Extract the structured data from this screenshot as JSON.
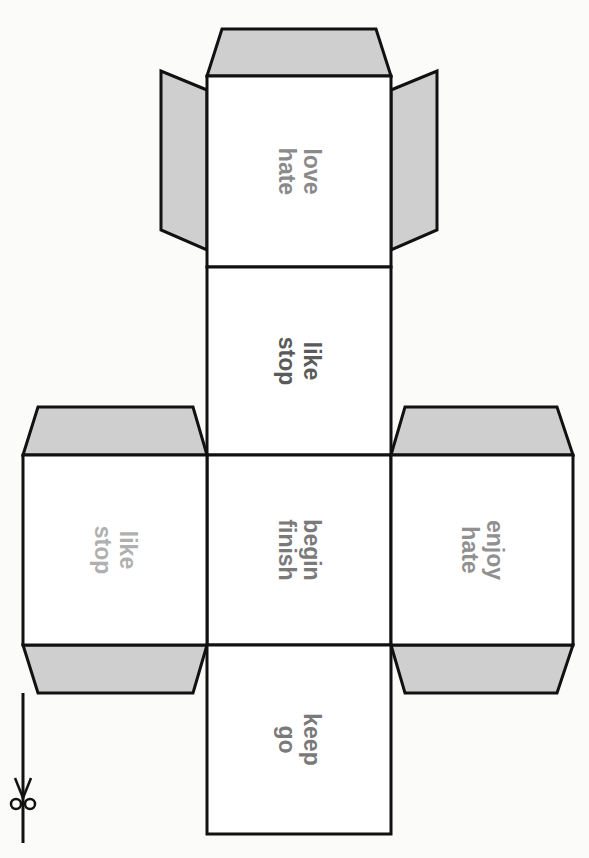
{
  "colors": {
    "outline": "#111111",
    "tab_fill": "#cfcfcf",
    "face_fill": "#ffffff",
    "background": "#fbfbfa"
  },
  "faces": [
    {
      "id": "top",
      "line1": "love",
      "line2": "hate",
      "color": "#8a8a8a"
    },
    {
      "id": "upper-middle",
      "line1": "like",
      "line2": "stop",
      "color": "#5a5a5a"
    },
    {
      "id": "center",
      "line1": "begin",
      "line2": "finish",
      "color": "#7a7a7a"
    },
    {
      "id": "left",
      "line1": "like",
      "line2": "stop",
      "color": "#b0b0b0"
    },
    {
      "id": "right",
      "line1": "enjoy",
      "line2": "hate",
      "color": "#909090"
    },
    {
      "id": "bottom",
      "line1": "keep",
      "line2": "go",
      "color": "#7a7a7a"
    }
  ],
  "cut_marker": {
    "icon": "scissors-icon"
  }
}
